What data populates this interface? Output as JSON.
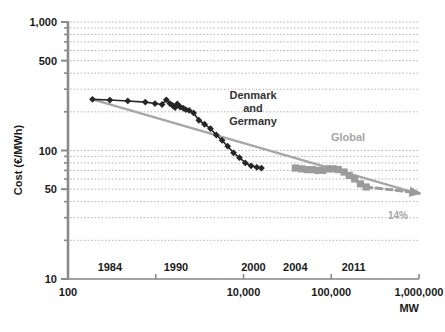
{
  "chart_data": {
    "type": "line",
    "title": "",
    "subtitle": "",
    "xlabel": "MW",
    "ylabel": "Cost (€/MWh)",
    "xscale": "log",
    "yscale": "log",
    "xlim": [
      100,
      1000000
    ],
    "ylim": [
      10,
      1000
    ],
    "grid": true,
    "grid_style": "dotted-horizontal-log-minor",
    "legend_position": "inline-annotations",
    "xticks": [
      100,
      1000,
      10000,
      100000,
      1000000
    ],
    "xticklabels": [
      "100",
      "",
      "10,000",
      "100,000",
      "1,000,000"
    ],
    "yticks": [
      10,
      50,
      100,
      500,
      1000
    ],
    "yticklabels": [
      "10",
      "50",
      "100",
      "500",
      "1,000"
    ],
    "x_secondary_axis": {
      "name": "year-markers",
      "entries": [
        {
          "label": "1984",
          "x": 300
        },
        {
          "label": "1990",
          "x": 1700
        },
        {
          "label": "2000",
          "x": 13000
        },
        {
          "label": "2004",
          "x": 39000
        },
        {
          "label": "2011",
          "x": 180000
        }
      ]
    },
    "annotations": [
      {
        "name": "denmark-germany-label",
        "text": "Denmark\nand\nGermany",
        "lines": [
          "Denmark",
          "and",
          "Germany"
        ],
        "color": "#333333",
        "x": 4000,
        "y": 260
      },
      {
        "name": "global-label",
        "text": "Global",
        "color": "#a6a6a6",
        "x": 85000,
        "y": 150
      },
      {
        "name": "learning-rate-label",
        "text": "14%",
        "color": "#a6a6a6",
        "x": 520000,
        "y": 36
      }
    ],
    "series": [
      {
        "name": "Denmark and Germany",
        "marker": "diamond",
        "color": "#262626",
        "linewidth": 1.6,
        "points": [
          [
            190,
            250
          ],
          [
            300,
            247
          ],
          [
            480,
            243
          ],
          [
            760,
            238
          ],
          [
            980,
            232
          ],
          [
            1180,
            228
          ],
          [
            1320,
            248
          ],
          [
            1450,
            232
          ],
          [
            1560,
            224
          ],
          [
            1660,
            216
          ],
          [
            1760,
            230
          ],
          [
            1900,
            218
          ],
          [
            2050,
            214
          ],
          [
            2200,
            208
          ],
          [
            2400,
            205
          ],
          [
            2700,
            196
          ],
          [
            3100,
            172
          ],
          [
            3600,
            160
          ],
          [
            4200,
            148
          ],
          [
            4900,
            132
          ],
          [
            5700,
            120
          ],
          [
            6600,
            108
          ],
          [
            7700,
            96
          ],
          [
            9000,
            88
          ],
          [
            10500,
            80
          ],
          [
            12200,
            76
          ],
          [
            14200,
            74
          ],
          [
            16000,
            73
          ]
        ]
      },
      {
        "name": "Global",
        "marker": "square",
        "color": "#9b9b9b",
        "linewidth": 3.2,
        "points": [
          [
            39000,
            73
          ],
          [
            46000,
            72
          ],
          [
            53000,
            71
          ],
          [
            61000,
            71
          ],
          [
            70000,
            70
          ],
          [
            80000,
            70
          ],
          [
            92000,
            72
          ],
          [
            105000,
            72
          ],
          [
            120000,
            71
          ],
          [
            140000,
            68
          ],
          [
            160000,
            64
          ],
          [
            185000,
            60
          ],
          [
            215000,
            55
          ],
          [
            250000,
            52
          ]
        ]
      },
      {
        "name": "Trend line",
        "marker": "none",
        "color": "#a6a6a6",
        "linewidth": 2.5,
        "style": "solid",
        "points": [
          [
            190,
            250
          ],
          [
            1000000,
            46
          ]
        ]
      },
      {
        "name": "Projection",
        "marker": "arrow",
        "color": "#9b9b9b",
        "linewidth": 3,
        "style": "dashed",
        "points": [
          [
            250000,
            52
          ],
          [
            950000,
            47
          ]
        ]
      }
    ]
  },
  "axes": {
    "y_title": "Cost (€/MWh)",
    "x_title": "MW",
    "y_labels": [
      "1,000",
      "500",
      "100",
      "50",
      "10"
    ],
    "x_labels": [
      "100",
      "10,000",
      "100,000",
      "1,000,000"
    ]
  },
  "labels": {
    "denmark_line1": "Denmark",
    "denmark_line2": "and",
    "denmark_line3": "Germany",
    "global": "Global",
    "learning_rate": "14%",
    "year_1984": "1984",
    "year_1990": "1990",
    "year_2000": "2000",
    "year_2004": "2004",
    "year_2011": "2011",
    "x_100": "100",
    "x_10000": "10,000",
    "x_100000": "100,000",
    "x_1000000": "1,000,000",
    "y_1000": "1,000",
    "y_500": "500",
    "y_100": "100",
    "y_50": "50",
    "y_10": "10"
  },
  "colors": {
    "dark_series": "#262626",
    "gray_series": "#9b9b9b",
    "trend": "#a6a6a6",
    "axis": "#7a7a7a",
    "grid": "#b5b5b5",
    "text": "#1a1a1a",
    "background": "#ffffff"
  }
}
